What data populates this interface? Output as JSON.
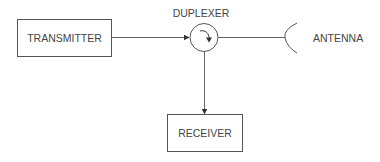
{
  "diagram": {
    "type": "block-diagram",
    "nodes": {
      "transmitter": {
        "label": "TRANSMITTER",
        "shape": "rectangle"
      },
      "duplexer": {
        "label": "DUPLEXER",
        "shape": "circulator-circle",
        "icon": "circulator-arrow-icon"
      },
      "antenna": {
        "label": "ANTENNA",
        "shape": "antenna-arc",
        "icon": "antenna-icon"
      },
      "receiver": {
        "label": "RECEIVER",
        "shape": "rectangle"
      }
    },
    "edges": [
      {
        "from": "transmitter",
        "to": "duplexer",
        "arrow": true
      },
      {
        "from": "duplexer",
        "to": "antenna",
        "arrow": false
      },
      {
        "from": "duplexer",
        "to": "receiver",
        "arrow": true
      }
    ]
  }
}
